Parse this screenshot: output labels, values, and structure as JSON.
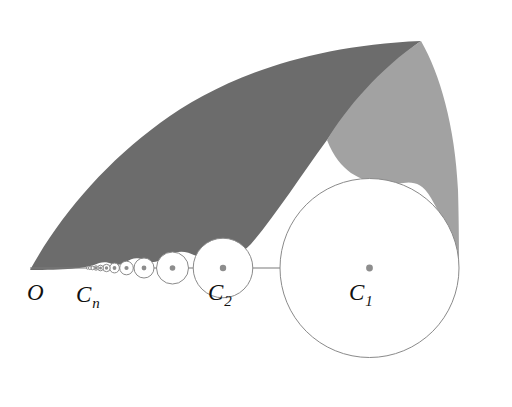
{
  "figure": {
    "canvas": {
      "width": 512,
      "height": 407,
      "background": "#ffffff"
    },
    "colors": {
      "dark_region": "#6c6c6c",
      "light_region": "#a2a2a2",
      "circle_stroke": "#8a8a8a",
      "axis_stroke": "#7a7a7a",
      "center_dot": "#8d8d8d",
      "label_text": "#111111"
    },
    "labels": [
      {
        "id": "origin",
        "base": "O",
        "sub": "",
        "x": 27,
        "y": 300
      },
      {
        "id": "c-n",
        "base": "C",
        "sub": "n",
        "x": 76,
        "y": 302
      },
      {
        "id": "c-2",
        "base": "C",
        "sub": "2",
        "x": 208,
        "y": 300
      },
      {
        "id": "c-1",
        "base": "C",
        "sub": "1",
        "x": 349,
        "y": 300
      }
    ],
    "axis": {
      "id": "baseline",
      "x1": 30,
      "y1": 268,
      "x2": 459,
      "y2": 268
    },
    "origin_point": {
      "x": 30,
      "y": 270
    },
    "apex_point": {
      "x": 421,
      "y": 41
    },
    "circles": [
      {
        "id": "C1",
        "cx": 369.5,
        "cy": 268,
        "r": 89.5,
        "labeled": "C_1"
      },
      {
        "id": "C2",
        "cx": 223.0,
        "cy": 268,
        "r": 29.8,
        "labeled": "C_2"
      },
      {
        "id": "C3",
        "cx": 172.5,
        "cy": 268,
        "r": 16.0,
        "labeled": ""
      },
      {
        "id": "C4",
        "cx": 144.0,
        "cy": 268,
        "r": 10.0,
        "labeled": ""
      },
      {
        "id": "C5",
        "cx": 126.5,
        "cy": 268,
        "r": 6.8,
        "labeled": ""
      },
      {
        "id": "C6",
        "cx": 114.5,
        "cy": 268,
        "r": 4.9,
        "labeled": ""
      },
      {
        "id": "C7",
        "cx": 106.5,
        "cy": 268,
        "r": 3.7,
        "labeled": ""
      },
      {
        "id": "C8",
        "cx": 100.5,
        "cy": 268,
        "r": 2.8,
        "labeled": ""
      },
      {
        "id": "C9",
        "cx": 96.0,
        "cy": 268,
        "r": 2.2,
        "labeled": ""
      },
      {
        "id": "C10",
        "cx": 92.5,
        "cy": 268,
        "r": 1.8,
        "labeled": ""
      },
      {
        "id": "C11",
        "cx": 89.8,
        "cy": 268,
        "r": 1.5,
        "labeled": ""
      },
      {
        "id": "C12",
        "cx": 87.6,
        "cy": 268,
        "r": 1.2,
        "labeled": ""
      }
    ],
    "center_dots": [
      {
        "cx": 369.5,
        "cy": 268,
        "r": 3.4
      },
      {
        "cx": 223.0,
        "cy": 268,
        "r": 3.2
      },
      {
        "cx": 172.5,
        "cy": 268,
        "r": 2.8
      },
      {
        "cx": 144.0,
        "cy": 268,
        "r": 2.4
      },
      {
        "cx": 126.5,
        "cy": 268,
        "r": 2.1
      },
      {
        "cx": 114.5,
        "cy": 268,
        "r": 1.9
      },
      {
        "cx": 106.5,
        "cy": 268,
        "r": 1.7
      },
      {
        "cx": 100.5,
        "cy": 268,
        "r": 1.5
      },
      {
        "cx": 96.0,
        "cy": 268,
        "r": 1.4
      }
    ],
    "regions": {
      "dark": {
        "id": "dark-shaded-region",
        "description": "Large dark lens between outer boundary arc and the chain-of-circles envelope",
        "path": "M 30 270 C 60 216 104 164 160 123 C 216 82 300 46 421 41 C 392 62 357 99 327 140 C 300 177 275 216 251 244 C 234 262 215 266 200 258 C 186 250 178 250 168 256 C 158 262 152 264 144 260 C 137 257 132 258 126 262 C 120 265 116 266 112 264 C 106 261 100 262 94 265 C 86 268 64 270 30 270 Z"
      },
      "light": {
        "id": "light-shaded-region",
        "description": "Lighter wedge right of the dark region, between outer arc, the circle C1 and the baseline end",
        "path": "M 421 41 C 440 74 455 126 458 190 C 459 224 459 252 459 268 C 453 245 444 220 431 198 C 415 170 396 190 381 184 C 360 180 340 173 327 140 C 345 110 380 68 421 41 Z"
      }
    }
  }
}
